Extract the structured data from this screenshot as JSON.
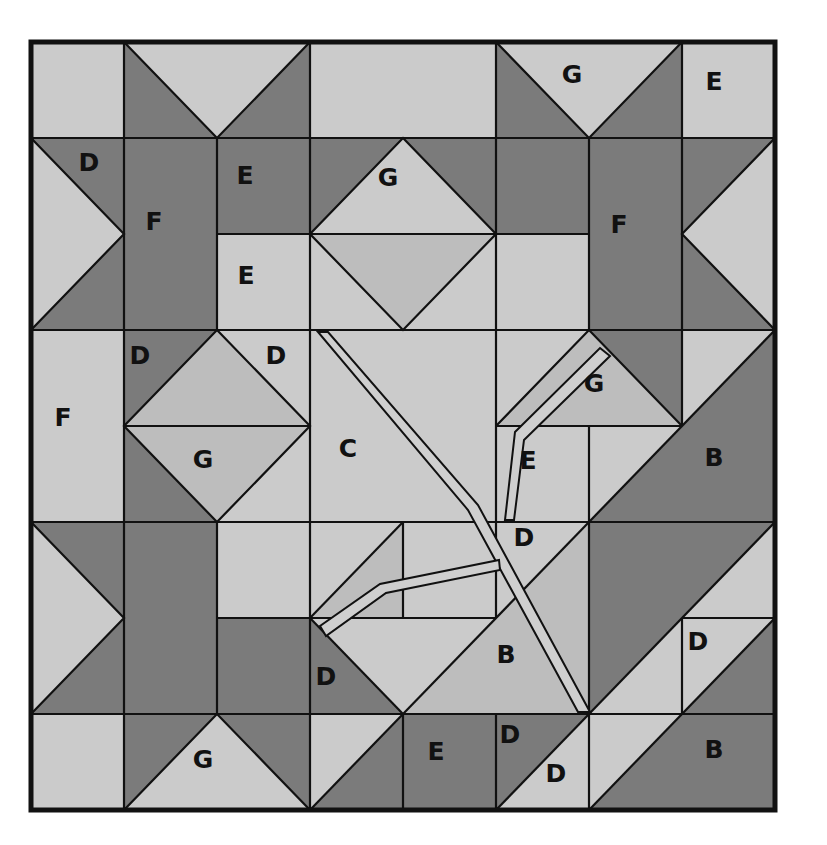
{
  "figure": {
    "type": "quilt-block-pattern",
    "colors": {
      "light": "#cbcbcb",
      "medium": "#bdbdbd",
      "dark": "#7b7b7b",
      "line": "#111111"
    }
  },
  "labels": [
    {
      "id": "g-top-right",
      "text": "G"
    },
    {
      "id": "e-top-right",
      "text": "E"
    },
    {
      "id": "d-top-left",
      "text": "D"
    },
    {
      "id": "f-left-star",
      "text": "F"
    },
    {
      "id": "e-upper-dark",
      "text": "E"
    },
    {
      "id": "g-upper-diamond",
      "text": "G"
    },
    {
      "id": "f-right-star",
      "text": "F"
    },
    {
      "id": "e-upper-light",
      "text": "E"
    },
    {
      "id": "d-mid-left-dark",
      "text": "D"
    },
    {
      "id": "d-mid-left-light",
      "text": "D"
    },
    {
      "id": "g-leaf",
      "text": "G"
    },
    {
      "id": "f-left-edge",
      "text": "F"
    },
    {
      "id": "g-mid-diamond",
      "text": "G"
    },
    {
      "id": "c-center",
      "text": "C"
    },
    {
      "id": "e-center",
      "text": "E"
    },
    {
      "id": "b-right-upper",
      "text": "B"
    },
    {
      "id": "d-center",
      "text": "D"
    },
    {
      "id": "d-right-lower",
      "text": "D"
    },
    {
      "id": "b-center-lower",
      "text": "B"
    },
    {
      "id": "d-lower-dark",
      "text": "D"
    },
    {
      "id": "g-bottom-left",
      "text": "G"
    },
    {
      "id": "e-bottom",
      "text": "E"
    },
    {
      "id": "d-bottom-dark",
      "text": "D"
    },
    {
      "id": "d-bottom-light",
      "text": "D"
    },
    {
      "id": "b-bottom-right",
      "text": "B"
    }
  ]
}
